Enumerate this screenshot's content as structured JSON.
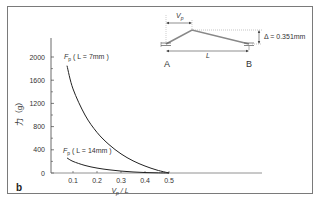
{
  "chart_data": {
    "type": "line",
    "panel_label": "b",
    "title": "",
    "xlabel": "Vp / L",
    "ylabel": "力（g）",
    "xlim": [
      0,
      0.5
    ],
    "ylim": [
      0,
      2000
    ],
    "x_ticks": [
      "0.1",
      "0.2",
      "0.3",
      "0.4",
      "0.5"
    ],
    "y_ticks": [
      "0",
      "400",
      "800",
      "1200",
      "1600",
      "2000"
    ],
    "grid": false,
    "legend": "inline labels",
    "series": [
      {
        "name": "Fp ( L = 7mm )",
        "label_main": "F",
        "label_sub": "p",
        "label_rest": " ( L = 7mm )",
        "x": [
          0.075,
          0.1,
          0.15,
          0.2,
          0.25,
          0.3,
          0.35,
          0.4,
          0.45,
          0.5
        ],
        "y": [
          1850,
          1450,
          1000,
          700,
          490,
          330,
          210,
          120,
          50,
          0
        ]
      },
      {
        "name": "Fp ( L = 14mm )",
        "label_main": "F",
        "label_sub": "p",
        "label_rest": " ( L = 14mm )",
        "x": [
          0.075,
          0.1,
          0.15,
          0.2,
          0.25,
          0.3,
          0.35,
          0.4,
          0.45,
          0.5
        ],
        "y": [
          260,
          200,
          130,
          85,
          55,
          33,
          18,
          8,
          3,
          0
        ]
      }
    ]
  },
  "diagram": {
    "vp_label": "Vp",
    "vp_main": "V",
    "vp_sub": "p",
    "delta_label": "Δ = 0.351mm",
    "length_label": "L",
    "point_a": "A",
    "point_b": "B"
  }
}
